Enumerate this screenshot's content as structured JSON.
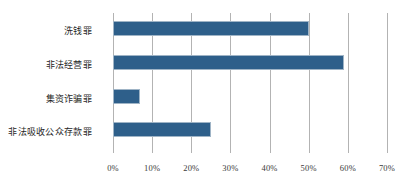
{
  "chart_data": {
    "type": "bar",
    "orientation": "horizontal",
    "title": "",
    "subtitle": "",
    "xlabel": "",
    "ylabel": "",
    "categories": [
      "洗钱罪",
      "非法经营罪",
      "集资诈骗罪",
      "非法吸收公众存款罪"
    ],
    "values": [
      50,
      59,
      7,
      25
    ],
    "value_unit": "%",
    "xlim": [
      0,
      70
    ],
    "xticks": [
      0,
      10,
      20,
      30,
      40,
      50,
      60,
      70
    ],
    "xtick_labels": [
      "0%",
      "10%",
      "20%",
      "30%",
      "40%",
      "50%",
      "60%",
      "70%"
    ],
    "grid": true,
    "grid_axis": "x",
    "legend": false,
    "legend_position": "none",
    "series": [
      {
        "name": "",
        "values": [
          50,
          59,
          7,
          25
        ]
      }
    ],
    "colors": {
      "bar_fill": "#2e5f8a",
      "bar_border": "#9fb4c6",
      "gridline": "#b3b3b3",
      "tick_label": "#3a3a3a",
      "category_label": "#1f1f1f",
      "background": "#ffffff"
    }
  }
}
